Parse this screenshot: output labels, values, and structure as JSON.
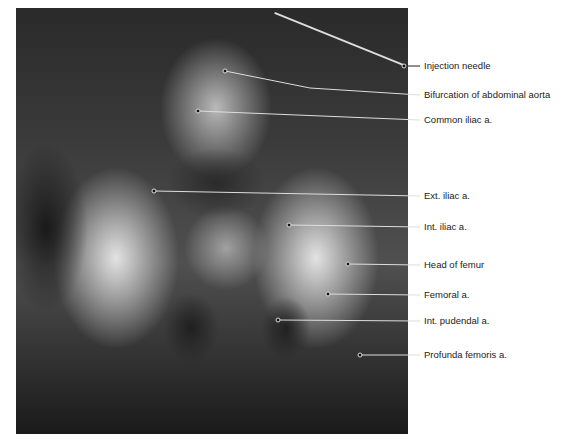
{
  "figure": {
    "image": "pelvic-arteriogram-xray",
    "labels": [
      {
        "text": "Injection needle",
        "y": 66,
        "point": [
          404,
          66
        ]
      },
      {
        "text": "Bifurcation of abdominal aorta",
        "y": 95,
        "point": [
          225,
          71
        ]
      },
      {
        "text": "Common iliac a.",
        "y": 120,
        "point": [
          198,
          111
        ]
      },
      {
        "text": "Ext. iliac a.",
        "y": 196,
        "point": [
          154,
          191
        ]
      },
      {
        "text": "Int. iliac a.",
        "y": 227,
        "point": [
          289,
          225
        ]
      },
      {
        "text": "Head of femur",
        "y": 265,
        "point": [
          348,
          264
        ]
      },
      {
        "text": "Femoral a.",
        "y": 295,
        "point": [
          328,
          294
        ]
      },
      {
        "text": "Int. pudendal a.",
        "y": 321,
        "point": [
          278,
          320
        ]
      },
      {
        "text": "Profunda femoris a.",
        "y": 355,
        "point": [
          360,
          355
        ]
      }
    ]
  }
}
